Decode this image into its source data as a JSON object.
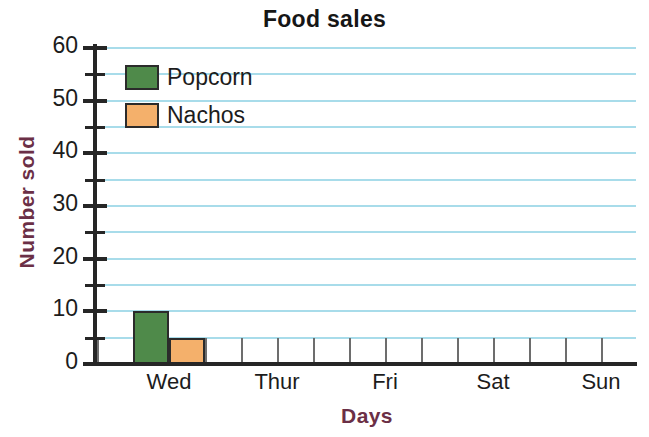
{
  "chart_data": {
    "type": "bar",
    "title": "Food sales",
    "xlabel": "Days",
    "ylabel": "Number sold",
    "categories": [
      "Wed",
      "Thur",
      "Fri",
      "Sat",
      "Sun"
    ],
    "series": [
      {
        "name": "Popcorn",
        "color": "#4f8a4a",
        "values": [
          10,
          0,
          0,
          0,
          0
        ]
      },
      {
        "name": "Nachos",
        "color": "#f4b06b",
        "values": [
          5,
          0,
          0,
          0,
          0
        ]
      }
    ],
    "ylim": [
      0,
      60
    ],
    "y_tick_labels": [
      "0",
      "10",
      "20",
      "30",
      "40",
      "50",
      "60"
    ],
    "y_tick_values": [
      0,
      10,
      20,
      30,
      40,
      50,
      60
    ],
    "y_minor_tick_values": [
      5,
      15,
      25,
      35,
      45,
      55
    ],
    "gridline_values": [
      5,
      10,
      15,
      20,
      25,
      30,
      35,
      40,
      45,
      50,
      55,
      60
    ],
    "grid": true,
    "legend_position": "top-left",
    "legend_entries": [
      "Popcorn",
      "Nachos"
    ],
    "colors": {
      "grid": "#a8dcea",
      "axis": "#262626",
      "axis_title": "#6b2f46",
      "title": "#161616",
      "popcorn": "#4f8a4a",
      "nachos": "#f4b06b",
      "bar_outline": "#2b2b2b",
      "slot_divider": "#6d6d6d"
    }
  }
}
